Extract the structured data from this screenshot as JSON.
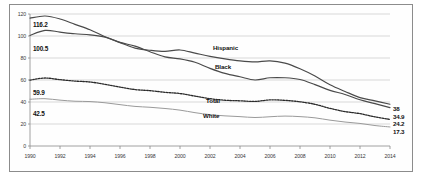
{
  "chart_data": {
    "type": "line",
    "title": "",
    "xlabel": "",
    "ylabel": "",
    "grid": true,
    "legend_position": "inline-labels",
    "xlim": [
      1990,
      2014
    ],
    "ylim": [
      0,
      120
    ],
    "x": [
      1990,
      1991,
      1992,
      1993,
      1994,
      1995,
      1996,
      1997,
      1998,
      1999,
      2000,
      2001,
      2002,
      2003,
      2004,
      2005,
      2006,
      2007,
      2008,
      2009,
      2010,
      2011,
      2012,
      2013,
      2014
    ],
    "y_ticks": [
      "0",
      "20",
      "40",
      "60",
      "80",
      "100",
      "120"
    ],
    "x_ticks": [
      "1990",
      "1992",
      "1994",
      "1996",
      "1998",
      "2000",
      "2002",
      "2004",
      "2006",
      "2008",
      "2010",
      "2012",
      "2014"
    ],
    "series": [
      {
        "name": "Black",
        "style": "solid",
        "start_label": "116.2",
        "end_label": "34.9",
        "values": [
          116.2,
          118.2,
          115.5,
          110.6,
          105.7,
          99.3,
          94.2,
          90.8,
          85.7,
          81.0,
          79.2,
          76.1,
          70.6,
          66.0,
          62.9,
          60.0,
          62.0,
          62.0,
          60.4,
          55.8,
          50.6,
          46.8,
          42.0,
          38.5,
          34.9
        ]
      },
      {
        "name": "Hispanic",
        "style": "solid",
        "start_label": "100.5",
        "end_label": "38",
        "values": [
          100.5,
          105.1,
          103.5,
          102.0,
          101.0,
          99.0,
          94.0,
          89.0,
          87.0,
          86.0,
          87.3,
          84.4,
          81.5,
          79.2,
          77.4,
          76.5,
          77.4,
          75.3,
          70.2,
          63.6,
          55.7,
          49.6,
          44.0,
          41.0,
          38.0
        ]
      },
      {
        "name": "Total",
        "style": "dashed",
        "start_label": "59.9",
        "end_label": "24.2",
        "values": [
          59.9,
          61.8,
          60.3,
          59.0,
          58.2,
          56.0,
          53.5,
          51.3,
          50.3,
          48.8,
          47.7,
          45.3,
          43.0,
          41.6,
          41.1,
          40.5,
          41.9,
          41.5,
          40.2,
          37.9,
          34.2,
          31.3,
          29.4,
          26.5,
          24.2
        ]
      },
      {
        "name": "White",
        "style": "solid-light",
        "start_label": "42.5",
        "end_label": "17.3",
        "values": [
          42.5,
          43.0,
          41.7,
          40.7,
          40.4,
          39.3,
          37.6,
          36.0,
          35.2,
          34.1,
          32.6,
          30.3,
          28.5,
          27.4,
          26.7,
          25.9,
          26.6,
          27.2,
          26.7,
          25.6,
          23.5,
          21.8,
          20.5,
          18.6,
          17.3
        ]
      }
    ],
    "annotations": [
      {
        "text": "116.2",
        "kind": "start-value",
        "series": "Black"
      },
      {
        "text": "100.5",
        "kind": "start-value",
        "series": "Hispanic"
      },
      {
        "text": "59.9",
        "kind": "start-value",
        "series": "Total"
      },
      {
        "text": "42.5",
        "kind": "start-value",
        "series": "White"
      },
      {
        "text": "38",
        "kind": "end-value",
        "series": "Hispanic"
      },
      {
        "text": "34.9",
        "kind": "end-value",
        "series": "Black"
      },
      {
        "text": "24.2",
        "kind": "end-value",
        "series": "Total"
      },
      {
        "text": "17.3",
        "kind": "end-value",
        "series": "White"
      },
      {
        "text": "Hispanic",
        "kind": "series-label",
        "series": "Hispanic"
      },
      {
        "text": "Black",
        "kind": "series-label",
        "series": "Black"
      },
      {
        "text": "Total",
        "kind": "series-label",
        "series": "Total"
      },
      {
        "text": "White",
        "kind": "series-label",
        "series": "White"
      }
    ],
    "colors": {
      "axis": "#8c8c8c",
      "grid": "#bfbfbf",
      "black_series": "#4a4a4a",
      "hispanic_series": "#4a4a4a",
      "total_series": "#2a2a2a",
      "white_series": "#9a9a9a",
      "text": "#111111",
      "background": "#ffffff"
    }
  }
}
